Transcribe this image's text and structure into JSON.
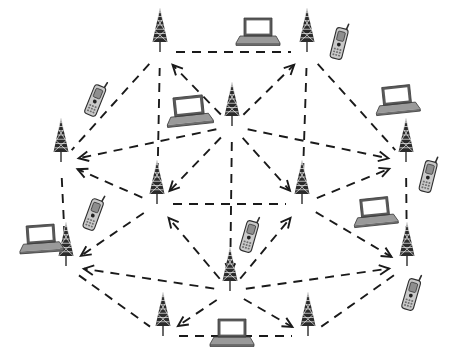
{
  "diagram": {
    "background_color": "#ffffff",
    "link_color": "#1a1a1a",
    "link_style": "dashed",
    "tower_color": "#2b2b2b",
    "laptop_color": "#6f6f6f",
    "phone_color": "#c9c9c9"
  },
  "nodes": [
    {
      "id": "t-top-left",
      "type": "antenna-tower",
      "label": "Tower",
      "x": 160,
      "y": 38
    },
    {
      "id": "t-top-right",
      "type": "antenna-tower",
      "label": "Tower",
      "x": 307,
      "y": 38
    },
    {
      "id": "t-left",
      "type": "antenna-tower",
      "label": "Tower",
      "x": 61,
      "y": 148
    },
    {
      "id": "t-right",
      "type": "antenna-tower",
      "label": "Tower",
      "x": 406,
      "y": 148
    },
    {
      "id": "t-bottom-left",
      "type": "antenna-tower",
      "label": "Tower",
      "x": 66,
      "y": 252
    },
    {
      "id": "t-bottom-right",
      "type": "antenna-tower",
      "label": "Tower",
      "x": 407,
      "y": 252
    },
    {
      "id": "t-lower-left",
      "type": "antenna-tower",
      "label": "Tower",
      "x": 163,
      "y": 322
    },
    {
      "id": "t-lower-right",
      "type": "antenna-tower",
      "label": "Tower",
      "x": 308,
      "y": 322
    },
    {
      "id": "t-hub-center",
      "type": "antenna-tower",
      "label": "Tower",
      "x": 232,
      "y": 112
    },
    {
      "id": "t-mid-left",
      "type": "antenna-tower",
      "label": "Tower",
      "x": 157,
      "y": 190
    },
    {
      "id": "t-mid-right",
      "type": "antenna-tower",
      "label": "Tower",
      "x": 302,
      "y": 190
    },
    {
      "id": "t-hub-bottom",
      "type": "antenna-tower",
      "label": "Tower",
      "x": 230,
      "y": 277
    }
  ],
  "devices": [
    {
      "id": "lap-top-center",
      "type": "laptop",
      "label": "Laptop",
      "x": 258,
      "y": 31,
      "scale": 1.0,
      "rotate": 0
    },
    {
      "id": "lap-mid-upper",
      "type": "laptop",
      "label": "Laptop",
      "x": 189,
      "y": 110,
      "scale": 1.05,
      "rotate": -6
    },
    {
      "id": "lap-upper-right",
      "type": "laptop",
      "label": "Laptop",
      "x": 397,
      "y": 99,
      "scale": 1.0,
      "rotate": -6
    },
    {
      "id": "lap-right-mid",
      "type": "laptop",
      "label": "Laptop",
      "x": 375,
      "y": 211,
      "scale": 1.0,
      "rotate": -6
    },
    {
      "id": "lap-left-lower",
      "type": "laptop",
      "label": "Laptop",
      "x": 41,
      "y": 238,
      "scale": 1.0,
      "rotate": -4
    },
    {
      "id": "lap-bottom-center",
      "type": "laptop",
      "label": "Laptop",
      "x": 232,
      "y": 332,
      "scale": 1.0,
      "rotate": 0
    },
    {
      "id": "ph-upper-left",
      "type": "mobile-phone",
      "label": "Mobile phone",
      "x": 95,
      "y": 101,
      "scale": 1.0,
      "rotate": 22
    },
    {
      "id": "ph-top-right",
      "type": "mobile-phone",
      "label": "Mobile phone",
      "x": 339,
      "y": 44,
      "scale": 1.0,
      "rotate": 14
    },
    {
      "id": "ph-right-upper",
      "type": "mobile-phone",
      "label": "Mobile phone",
      "x": 428,
      "y": 177,
      "scale": 1.0,
      "rotate": 14
    },
    {
      "id": "ph-left-mid",
      "type": "mobile-phone",
      "label": "Mobile phone",
      "x": 93,
      "y": 215,
      "scale": 1.0,
      "rotate": 20
    },
    {
      "id": "ph-center-mid",
      "type": "mobile-phone",
      "label": "Mobile phone",
      "x": 249,
      "y": 237,
      "scale": 1.0,
      "rotate": 16
    },
    {
      "id": "ph-right-lower",
      "type": "mobile-phone",
      "label": "Mobile phone",
      "x": 411,
      "y": 295,
      "scale": 1.0,
      "rotate": 16
    }
  ],
  "links": [
    {
      "from": "t-top-left",
      "to": "t-top-right",
      "arrow": "none"
    },
    {
      "from": "t-top-left",
      "to": "t-left",
      "arrow": "none"
    },
    {
      "from": "t-top-right",
      "to": "t-right",
      "arrow": "none"
    },
    {
      "from": "t-left",
      "to": "t-bottom-left",
      "arrow": "none"
    },
    {
      "from": "t-right",
      "to": "t-bottom-right",
      "arrow": "none"
    },
    {
      "from": "t-bottom-left",
      "to": "t-lower-left",
      "arrow": "none"
    },
    {
      "from": "t-bottom-right",
      "to": "t-lower-right",
      "arrow": "none"
    },
    {
      "from": "t-lower-left",
      "to": "t-lower-right",
      "arrow": "none"
    },
    {
      "from": "t-hub-center",
      "to": "t-top-left",
      "arrow": "end"
    },
    {
      "from": "t-hub-center",
      "to": "t-top-right",
      "arrow": "end"
    },
    {
      "from": "t-hub-center",
      "to": "t-left",
      "arrow": "end"
    },
    {
      "from": "t-hub-center",
      "to": "t-right",
      "arrow": "end"
    },
    {
      "from": "t-hub-center",
      "to": "t-mid-left",
      "arrow": "end"
    },
    {
      "from": "t-hub-center",
      "to": "t-mid-right",
      "arrow": "end"
    },
    {
      "from": "t-hub-center",
      "to": "t-hub-bottom",
      "arrow": "end"
    },
    {
      "from": "t-hub-bottom",
      "to": "t-bottom-left",
      "arrow": "end"
    },
    {
      "from": "t-hub-bottom",
      "to": "t-bottom-right",
      "arrow": "end"
    },
    {
      "from": "t-hub-bottom",
      "to": "t-lower-left",
      "arrow": "end"
    },
    {
      "from": "t-hub-bottom",
      "to": "t-lower-right",
      "arrow": "end"
    },
    {
      "from": "t-hub-bottom",
      "to": "t-mid-left",
      "arrow": "end"
    },
    {
      "from": "t-hub-bottom",
      "to": "t-mid-right",
      "arrow": "end"
    },
    {
      "from": "t-mid-left",
      "to": "t-left",
      "arrow": "end"
    },
    {
      "from": "t-mid-left",
      "to": "t-bottom-left",
      "arrow": "end"
    },
    {
      "from": "t-mid-left",
      "to": "t-mid-right",
      "arrow": "none"
    },
    {
      "from": "t-mid-right",
      "to": "t-right",
      "arrow": "end"
    },
    {
      "from": "t-mid-right",
      "to": "t-bottom-right",
      "arrow": "end"
    },
    {
      "from": "t-mid-left",
      "to": "t-top-left",
      "arrow": "none"
    },
    {
      "from": "t-mid-right",
      "to": "t-top-right",
      "arrow": "none"
    }
  ]
}
